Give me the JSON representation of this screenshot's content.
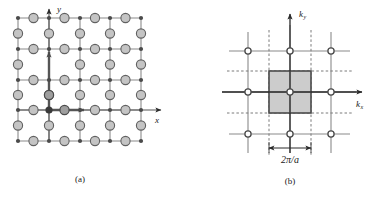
{
  "figure": {
    "background_color": "#ffffff",
    "panels": [
      {
        "id": "a",
        "caption": "(a)",
        "description": "real-space square lattice",
        "axes": [
          {
            "name": "x-axis",
            "label": "x",
            "subscript": "",
            "direction": "right"
          },
          {
            "name": "y-axis",
            "label": "y",
            "subscript": "",
            "direction": "up"
          }
        ],
        "lattice": {
          "type": "square-lattice-with-edge-atoms",
          "grid_columns": 5,
          "grid_rows": 5,
          "corner_atom_color": "#4a4a4a",
          "edge_atom_fill": "#c4c4c4",
          "edge_atom_stroke": "#606060",
          "origin_atom_color": "#3a3a3a",
          "line_color": "#8a8a8a"
        },
        "basis_vectors": [
          {
            "name": "a1",
            "direction": "right",
            "color": "#555555"
          },
          {
            "name": "a2",
            "direction": "up",
            "color": "#555555"
          }
        ]
      },
      {
        "id": "b",
        "caption": "(b)",
        "description": "reciprocal-space lattice with first Brillouin zone",
        "axes": [
          {
            "name": "kx-axis",
            "label": "k",
            "subscript": "x",
            "direction": "right"
          },
          {
            "name": "ky-axis",
            "label": "k",
            "subscript": "y",
            "direction": "up"
          }
        ],
        "lattice": {
          "type": "square-reciprocal-lattice",
          "grid_columns": 3,
          "grid_rows": 3,
          "point_fill": "#ffffff",
          "point_stroke": "#4a4a4a",
          "line_color": "#8a8a8a",
          "dashed_line_color": "#7a7a7a"
        },
        "brillouin_zone": {
          "name": "first-brillouin-zone",
          "fill": "#cccccc",
          "stroke": "#4a4a4a"
        },
        "dimension": {
          "label": "2π/a",
          "arrow": "double-headed"
        }
      }
    ]
  }
}
